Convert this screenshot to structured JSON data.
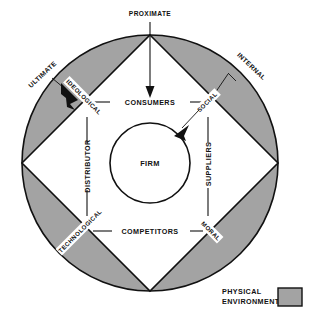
{
  "diagram": {
    "title_visible": false,
    "colors": {
      "shaded_segment": "#a3a3a3",
      "shaded_segment_edge": "#111111",
      "line": "#111111",
      "background": "#ffffff",
      "legend_swatch": "#a3a3a3"
    },
    "outer_annotations": [
      {
        "label": "PROXIMATE",
        "position": "top"
      },
      {
        "label": "ULTIMATE",
        "position": "upper-left"
      },
      {
        "label": "INTERNAL",
        "position": "upper-right"
      }
    ],
    "diamond_sides": [
      {
        "label": "CONSUMERS",
        "position": "top"
      },
      {
        "label": "SUPPLIERS",
        "position": "right"
      },
      {
        "label": "COMPETITORS",
        "position": "bottom"
      },
      {
        "label": "DISTRIBUTOR",
        "position": "left"
      }
    ],
    "band_labels": [
      {
        "label": "IDEOLOGICAL",
        "position": "upper-left"
      },
      {
        "label": "SOCIAL",
        "position": "upper-right"
      },
      {
        "label": "MORAL",
        "position": "lower-right"
      },
      {
        "label": "TECHNOLOGICAL",
        "position": "lower-left"
      }
    ],
    "center": {
      "label": "FIRM"
    },
    "legend": {
      "line1": "PHYSICAL",
      "line2": "ENVIRONMENT"
    }
  }
}
